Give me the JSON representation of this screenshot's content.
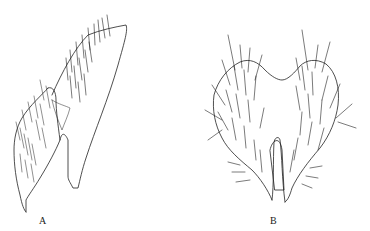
{
  "figure": {
    "panels": [
      {
        "id": "A",
        "label": "A",
        "description": "lateral view, sclerite with setae and stippled area"
      },
      {
        "id": "B",
        "label": "B",
        "description": "dorsal/ventral view, bilobed plate with setae and central stippled cleft"
      }
    ],
    "colors": {
      "ink": "#222222",
      "background": "#ffffff"
    }
  }
}
